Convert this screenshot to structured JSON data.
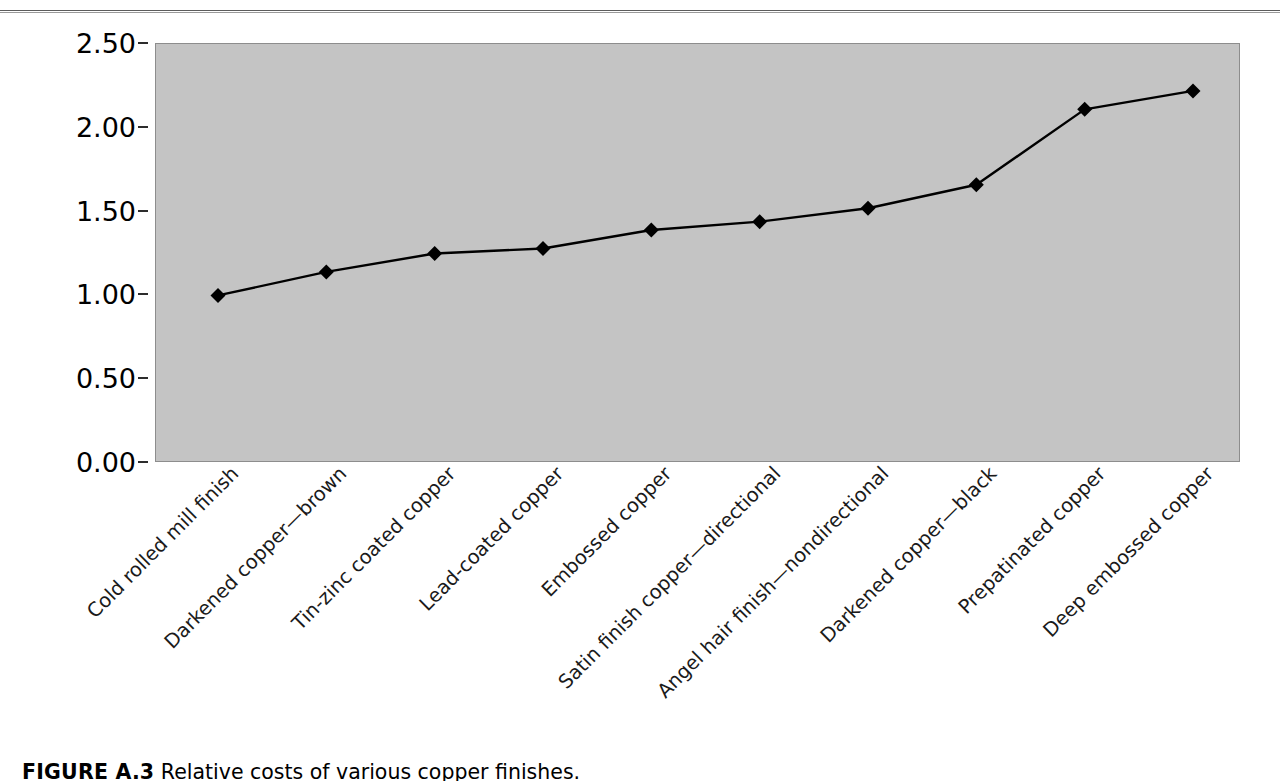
{
  "header": {
    "rule_visible": true,
    "text": ""
  },
  "figure": {
    "caption_label": "FIGURE A.3",
    "caption_text": "Relative costs of various copper finishes."
  },
  "axis": {
    "y_ticks": [
      "0.00",
      "0.50",
      "1.00",
      "1.50",
      "2.00",
      "2.50"
    ]
  },
  "colors": {
    "plot_background": "#c4c4c4",
    "plot_border": "#8d8d8d",
    "series_line": "#000000",
    "marker": "#000000",
    "text": "#000000",
    "page_background": "#ffffff"
  },
  "chart_data": {
    "type": "line",
    "title": "",
    "subtitle": "",
    "xlabel": "",
    "ylabel": "",
    "ylim": [
      0,
      2.5
    ],
    "ytick_step": 0.5,
    "grid": false,
    "legend": "none",
    "marker_style": "diamond",
    "categories": [
      "Cold rolled mill finish",
      "Darkened copper—brown",
      "Tin-zinc coated copper",
      "Lead-coated copper",
      "Embossed copper",
      "Satin finish copper—directional",
      "Angel hair finish—nondirectional",
      "Darkened copper—black",
      "Prepatinated copper",
      "Deep embossed copper"
    ],
    "series": [
      {
        "name": "Relative cost",
        "values": [
          1.0,
          1.14,
          1.25,
          1.28,
          1.39,
          1.44,
          1.52,
          1.66,
          2.11,
          2.22
        ]
      }
    ]
  }
}
